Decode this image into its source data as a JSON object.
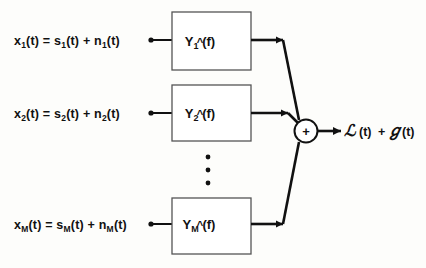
{
  "figure": {
    "type": "block-diagram",
    "background_color": "#fdfdfb",
    "ink_color": "#111111"
  },
  "inputs": [
    {
      "id": "channel-1",
      "label": "x₁(t) = s₁(t) + n₁(t)",
      "base": "x",
      "subscript": "1",
      "full_text": "x1(t) = s1(t) + n1(t)"
    },
    {
      "id": "channel-2",
      "label": "x₂(t) = s₂(t) + n₂(t)",
      "base": "x",
      "subscript": "2",
      "full_text": "x2(t) = s2(t) + n2(t)"
    },
    {
      "id": "channel-M",
      "label": "xₘ(t) = sₘ(t) + nₘ(t)",
      "base": "x",
      "subscript": "M",
      "full_text": "xM(t) = sM(t) + nM(t)"
    }
  ],
  "blocks": [
    {
      "id": "filter-1",
      "symbol": "Y",
      "accent": "^",
      "subscript": "1",
      "argument": "(f)",
      "label": "Ŷ₁(f)"
    },
    {
      "id": "filter-2",
      "symbol": "Y",
      "accent": "^",
      "subscript": "2",
      "argument": "(f)",
      "label": "Ŷ₂(f)"
    },
    {
      "id": "filter-M",
      "symbol": "Y",
      "accent": "^",
      "subscript": "M",
      "argument": "(f)",
      "label": "Ŷₘ(f)"
    }
  ],
  "ellipsis": {
    "label": "vertical-ellipsis",
    "dot_count": 3
  },
  "summer": {
    "id": "summing-junction",
    "operator": "+"
  },
  "output": {
    "id": "output-signal",
    "script_s": "ℒ",
    "script_n": "ℊ",
    "s_term": "(t)",
    "plus": "+",
    "n_term": "(t)",
    "full_text": "S(t) + N(t)"
  }
}
